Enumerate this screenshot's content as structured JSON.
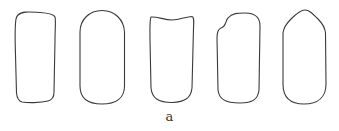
{
  "figure": {
    "panel_label": "a",
    "stroke_color": "#3a3a3a",
    "shapes": [
      {
        "name": "rounded-rectangle-slanted-top",
        "path": "M18,15 C22,11 30,12 40,12.5 C48,13 54,14 55,17 C56,21 55,28 55,40 L54,92 C54,98 52,100 48,101 C40,103 28,103 22,102 C18,101 17,98 16.5,93 L15.5,55 C15,40 15,25 16,19 C16.5,17 17,16 18,15 Z"
      },
      {
        "name": "rounded-oblong",
        "path": "M102,10.5 C115,10.5 124,20 124.5,32 L124.5,86 C124.5,98 116,104 102,104 C88,104 80,98 80,86 L80,32 C80,20 89,10.5 102,10.5 Z"
      },
      {
        "name": "concave-top-rectangle",
        "path": "M151,17 C158,16.5 164,20 172,20 C180,20 186,16.5 192,16.5 C194,17 194,20 193.5,28 L192,88 C191,98 185,102 172,102.5 C158,102.5 152,98 151,88 L150,40 C150,28 149.5,20 151,17 Z"
      },
      {
        "name": "notched-rounded-rectangle",
        "path": "M228,18 C232,13 238,13 245,13 C255,13 260,18 260,26 L259,90 C258,99 253,103 240,103 C225,103 219,99 218,90 L217,38 C217,32 218,29 221,28 C224,27 225,25 226,22 C226.5,20 227,19 228,18 Z"
      },
      {
        "name": "pointed-top-oblong",
        "path": "M305,10 C309,10 312,13 318,19 C323,24 325,28 325.5,33 L326,84 C326,97 318,104 304,104 C290,104 283,97 283,84 L283,33 C283.5,28 286,24 291,19 C297,13 301,10 305,10 Z"
      }
    ]
  }
}
